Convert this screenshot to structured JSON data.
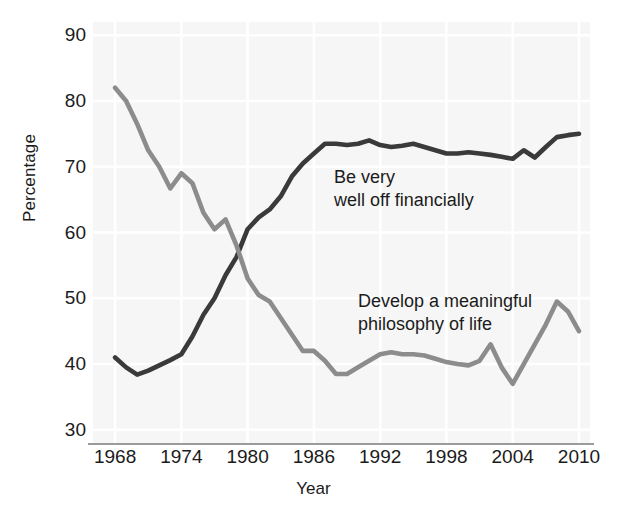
{
  "chart_data": {
    "type": "line",
    "title": "",
    "xlabel": "Year",
    "ylabel": "Percentage",
    "xlim": [
      1966,
      2011
    ],
    "ylim": [
      28,
      92
    ],
    "grid": true,
    "legend_position": "inline-annotation",
    "x_ticks": [
      "1968",
      "1974",
      "1980",
      "1986",
      "1992",
      "1998",
      "2004",
      "2010"
    ],
    "y_ticks": [
      "30",
      "40",
      "50",
      "60",
      "70",
      "80",
      "90"
    ],
    "x": [
      1968,
      1969,
      1970,
      1971,
      1972,
      1973,
      1974,
      1975,
      1976,
      1977,
      1978,
      1979,
      1980,
      1981,
      1982,
      1983,
      1984,
      1985,
      1986,
      1987,
      1988,
      1989,
      1990,
      1991,
      1992,
      1993,
      1994,
      1995,
      1996,
      1997,
      1998,
      1999,
      2000,
      2001,
      2002,
      2003,
      2004,
      2005,
      2006,
      2007,
      2008,
      2009,
      2010
    ],
    "series": [
      {
        "name": "Be very well off financially",
        "color": "#3a3a3a",
        "values": [
          41.0,
          39.5,
          38.4,
          39.0,
          39.8,
          40.6,
          41.5,
          44.2,
          47.5,
          50.0,
          53.5,
          56.3,
          60.5,
          62.3,
          63.5,
          65.5,
          68.5,
          70.5,
          72.0,
          73.5,
          73.5,
          73.3,
          73.5,
          74.0,
          73.3,
          73.0,
          73.2,
          73.5,
          73.0,
          72.5,
          72.0,
          72.0,
          72.2,
          72.0,
          71.8,
          71.5,
          71.2,
          72.5,
          71.4,
          73.0,
          74.5,
          74.8,
          75.0
        ]
      },
      {
        "name": "Develop a meaningful philosophy of life",
        "color": "#8c8c8c",
        "values": [
          82.0,
          80.0,
          76.5,
          72.5,
          70.0,
          66.7,
          69.0,
          67.5,
          63.0,
          60.5,
          62.0,
          58.0,
          53.0,
          50.5,
          49.5,
          47.0,
          44.5,
          42.0,
          42.0,
          40.5,
          38.5,
          38.5,
          39.5,
          40.5,
          41.5,
          41.8,
          41.5,
          41.5,
          41.3,
          40.8,
          40.3,
          40.0,
          39.8,
          40.5,
          43.0,
          39.5,
          37.0,
          40.0,
          43.0,
          46.0,
          49.5,
          48.0,
          45.0
        ]
      }
    ],
    "annotations": [
      {
        "text": "Be very\nwell off financially",
        "series": "Be very well off financially"
      },
      {
        "text": "Develop a meaningful\nphilosophy of life",
        "series": "Develop a meaningful philosophy of life"
      }
    ]
  },
  "axes": {
    "y_title": "Percentage",
    "x_title": "Year"
  }
}
